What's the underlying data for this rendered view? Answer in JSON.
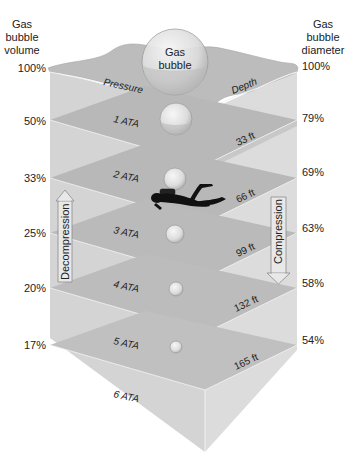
{
  "left_header": {
    "line1": "Gas",
    "line2": "bubble",
    "line3": "volume"
  },
  "right_header": {
    "line1": "Gas",
    "line2": "bubble",
    "line3": "diameter"
  },
  "surface": {
    "pressure_label": "Pressure",
    "depth_label": "Depth",
    "bubble_label_1": "Gas",
    "bubble_label_2": "bubble"
  },
  "levels": [
    {
      "volume": "100%",
      "diameter": "100%",
      "ata": "",
      "depth": ""
    },
    {
      "volume": "50%",
      "diameter": "79%",
      "ata": "1 ATA",
      "depth": "33 ft"
    },
    {
      "volume": "33%",
      "diameter": "69%",
      "ata": "2 ATA",
      "depth": "66 ft"
    },
    {
      "volume": "25%",
      "diameter": "63%",
      "ata": "3 ATA",
      "depth": "99 ft"
    },
    {
      "volume": "20%",
      "diameter": "58%",
      "ata": "4 ATA",
      "depth": "132 ft"
    },
    {
      "volume": "17%",
      "diameter": "54%",
      "ata": "5 ATA",
      "depth": "165 ft"
    },
    {
      "volume": "",
      "diameter": "",
      "ata": "6 ATA",
      "depth": ""
    }
  ],
  "arrows": {
    "decompression": "Decompression",
    "compression": "Compression"
  },
  "icons": {
    "diver": "scuba-diver-icon"
  },
  "colors": {
    "plane_dark": "#b9b9b9",
    "plane_light": "#d9d9d9",
    "box_face": "#d2d2d2",
    "surface": "#bdbdbd",
    "bubble": "#e6e6e6"
  }
}
